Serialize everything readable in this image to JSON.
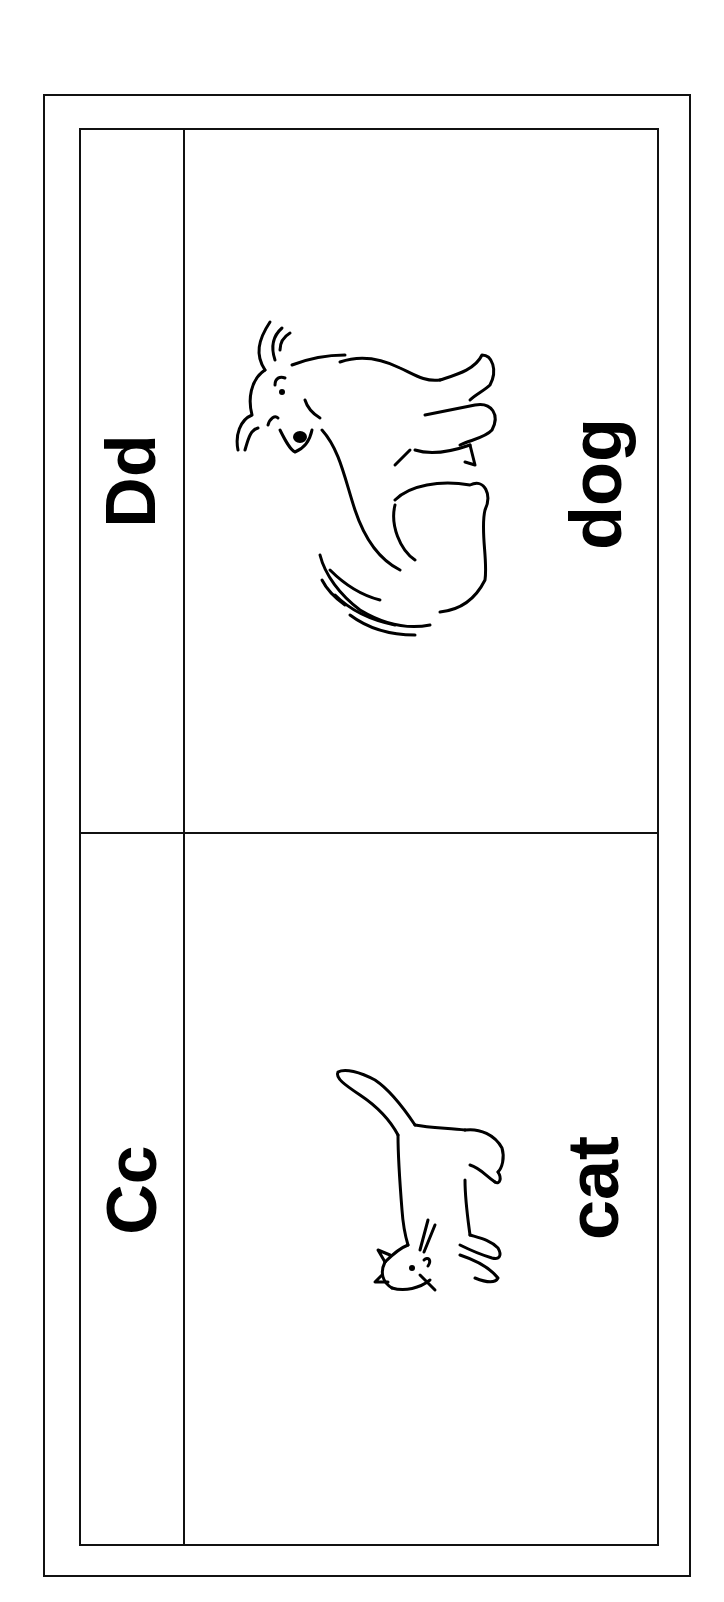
{
  "worksheet": {
    "cards": [
      {
        "letters": "Dd",
        "word": "dog",
        "picture": "dog-illustration"
      },
      {
        "letters": "Cc",
        "word": "cat",
        "picture": "cat-illustration"
      }
    ],
    "colors": {
      "ink": "#000000",
      "paper": "#ffffff"
    }
  }
}
